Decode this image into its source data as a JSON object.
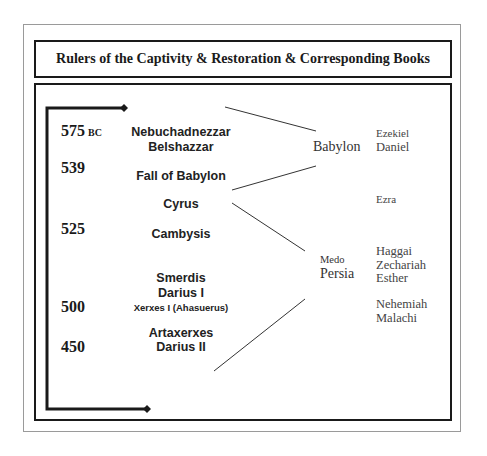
{
  "title": "Rulers of the Captivity & Restoration & Corresponding Books",
  "years": [
    {
      "value": "575",
      "suffix": "BC"
    },
    {
      "value": "539",
      "suffix": ""
    },
    {
      "value": "525",
      "suffix": ""
    },
    {
      "value": "500",
      "suffix": ""
    },
    {
      "value": "450",
      "suffix": ""
    }
  ],
  "rulers": [
    "Nebuchadnezzar",
    "Belshazzar",
    "Fall of Babylon",
    "Cyrus",
    "Cambysis",
    "Smerdis",
    "Darius I",
    "Xerxes I (Ahasuerus)",
    "Artaxerxes",
    "Darius II"
  ],
  "empires": {
    "babylon": "Babylon",
    "medo": "Medo",
    "persia": "Persia"
  },
  "books": {
    "babylon_period": [
      "Ezekiel",
      "Daniel"
    ],
    "restoration_early": [
      "Ezra"
    ],
    "persia_period": [
      "Haggai",
      "Zechariah",
      "Esther"
    ],
    "persia_late": [
      "Nehemiah",
      "Malachi"
    ]
  },
  "timeline": {
    "start_marker": "diamond-arrow",
    "end_marker": "diamond-arrow"
  }
}
